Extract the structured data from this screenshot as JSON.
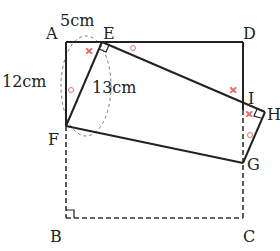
{
  "diagram": {
    "type": "geometry-figure",
    "points": {
      "A": {
        "label": "A",
        "x": 66,
        "y": 42
      },
      "E": {
        "label": "E",
        "x": 102,
        "y": 42
      },
      "D": {
        "label": "D",
        "x": 243,
        "y": 42
      },
      "F": {
        "label": "F",
        "x": 66,
        "y": 126
      },
      "I": {
        "label": "I",
        "x": 243,
        "y": 110
      },
      "H": {
        "label": "H",
        "x": 265,
        "y": 112
      },
      "G": {
        "label": "G",
        "x": 243,
        "y": 163
      },
      "B": {
        "label": "B",
        "x": 66,
        "y": 218
      },
      "C": {
        "label": "C",
        "x": 243,
        "y": 218
      }
    },
    "measurements": {
      "AE": "5cm",
      "AF": "12cm",
      "EF": "13cm"
    },
    "markers": {
      "angle_cross": "×",
      "angle_circle": "○"
    },
    "colors": {
      "line": "#222222",
      "marker": "#e07070",
      "dashed": "#333333"
    }
  }
}
